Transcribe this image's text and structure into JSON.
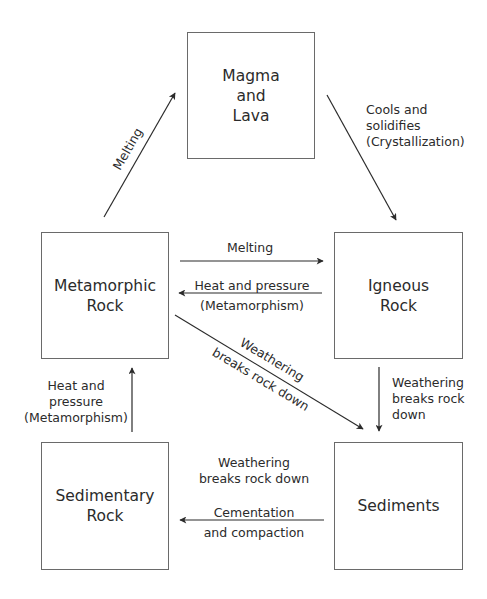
{
  "diagram": {
    "colors": {
      "line": "#2b2b2b",
      "box_border": "#6a6a6a",
      "text": "#2b2b2b",
      "background": "#ffffff"
    },
    "nodes": {
      "magma": {
        "line1": "Magma",
        "line2": "and",
        "line3": "Lava"
      },
      "metamorphic": {
        "line1": "Metamorphic",
        "line2": "Rock"
      },
      "igneous": {
        "line1": "Igneous",
        "line2": "Rock"
      },
      "sedimentary": {
        "line1": "Sedimentary",
        "line2": "Rock"
      },
      "sediments": {
        "line1": "Sediments"
      }
    },
    "edges": {
      "metamorphic_to_magma": {
        "from": "Metamorphic Rock",
        "to": "Magma and Lava",
        "label": "Melting"
      },
      "magma_to_igneous": {
        "from": "Magma and Lava",
        "to": "Igneous Rock",
        "line1": "Cools and",
        "line2": "solidifies",
        "line3": "(Crystallization)"
      },
      "metamorphic_to_igneous": {
        "from": "Metamorphic Rock",
        "to": "Igneous Rock",
        "label": "Melting"
      },
      "igneous_to_metamorphic": {
        "from": "Igneous Rock",
        "to": "Metamorphic Rock",
        "line1": "Heat and pressure",
        "line2": "(Metamorphism)"
      },
      "metamorphic_to_sediments": {
        "from": "Metamorphic Rock",
        "to": "Sediments",
        "line1": "Weathering",
        "line2": "breaks rock down"
      },
      "igneous_to_sediments": {
        "from": "Igneous Rock",
        "to": "Sediments",
        "line1": "Weathering",
        "line2": "breaks rock",
        "line3": "down"
      },
      "sedimentary_to_metamorphic": {
        "from": "Sedimentary Rock",
        "to": "Metamorphic Rock",
        "line1": "Heat and",
        "line2": "pressure",
        "line3": "(Metamorphism)"
      },
      "sedimentary_to_sediments_note": {
        "line1": "Weathering",
        "line2": "breaks rock down"
      },
      "sediments_to_sedimentary": {
        "from": "Sediments",
        "to": "Sedimentary Rock",
        "line1": "Cementation",
        "line2": "and compaction"
      }
    }
  }
}
